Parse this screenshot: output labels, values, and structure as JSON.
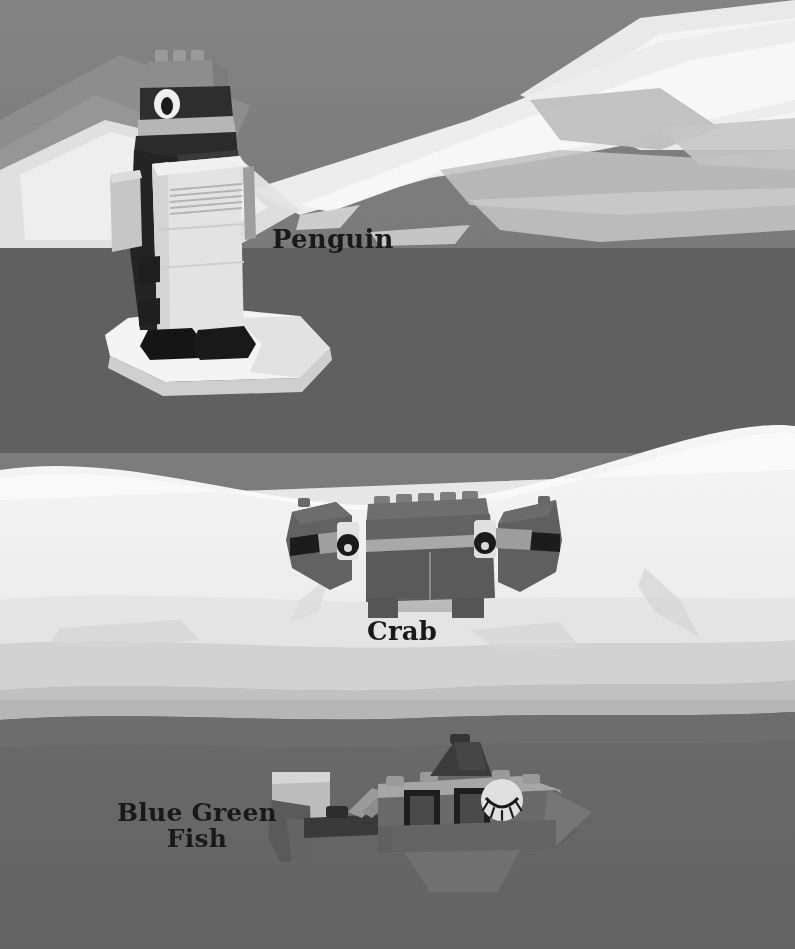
{
  "page": {
    "width": 795,
    "height": 949,
    "style": "grayscale photo montage"
  },
  "palette": {
    "sky": "#7e7e7e",
    "sky_shadow": "#8d8d8d",
    "iceberg_bright": "#efefef",
    "iceberg_mid": "#d9d9d9",
    "iceberg_dim": "#b9b9b9",
    "water_dark": "#5f5f5f",
    "water_mid": "#6d6d6d",
    "snow_white": "#f2f2f2",
    "snow_shade": "#cfcfcf",
    "deep_water": "#666666",
    "label_text": "#191919",
    "brick_gray": "#8a8a8a",
    "brick_dark": "#3a3a3a",
    "brick_black": "#1f1f1f",
    "brick_white": "#e6e6e6",
    "brick_light": "#cfcfcf",
    "brick_mid": "#6f6f6f"
  },
  "labels": [
    {
      "id": "penguin",
      "text": "Penguin",
      "x": 272,
      "y": 226,
      "font_size": 26,
      "lines": 1
    },
    {
      "id": "crab",
      "text": "Crab",
      "x": 367,
      "y": 618,
      "font_size": 26,
      "lines": 1
    },
    {
      "id": "fish",
      "text": "Blue Green\nFish",
      "x": 117,
      "y": 800,
      "font_size": 25,
      "lines": 2
    }
  ],
  "models": [
    {
      "id": "penguin",
      "name": "Penguin",
      "label": "Penguin",
      "scene": "standing on a white ice floe in front of icebergs",
      "bricks": [
        "gray 2x2 head top with studs",
        "dark head stripe with white round eye",
        "light gray beak slope",
        "black body sides",
        "white 2x4 belly with ribbed grille brick",
        "light gray flipper slabs on each side",
        "black wedge feet"
      ]
    },
    {
      "id": "crab",
      "name": "Crab",
      "label": "Crab",
      "scene": "on a snow drift",
      "bricks": [
        "dark gray 1x6 top body with studs",
        "light gray center stripe",
        "two white round eye holders with black eyes",
        "two dark gray wedge claws left and right",
        "two short legs under body"
      ]
    },
    {
      "id": "fish",
      "name": "Blue Green Fish",
      "label": "Blue Green\nFish",
      "scene": "swimming in dark water",
      "bricks": [
        "light gray tail fin wedge",
        "dark gray tail body plate",
        "mid gray angled connector to body",
        "light gray top slope with studs",
        "dark dorsal fin wedge",
        "two dark window panels on the side",
        "white round eye tile with closed eyelashes",
        "gray nose wedge to the right"
      ]
    }
  ],
  "background": {
    "bands": [
      {
        "name": "sky",
        "y": 0,
        "height": 248,
        "color": "#7e7e7e"
      },
      {
        "name": "upper-water",
        "y": 248,
        "height": 200,
        "color": "#5f5f5f"
      },
      {
        "name": "snow-field",
        "y": 448,
        "height": 190,
        "color": "#f2f2f2"
      },
      {
        "name": "shelf-shade",
        "y": 638,
        "height": 70,
        "color": "#c7c7c7"
      },
      {
        "name": "deep-water",
        "y": 708,
        "height": 241,
        "color": "#666666"
      }
    ],
    "icebergs": "pale angular iceberg silhouettes across the upper right"
  }
}
